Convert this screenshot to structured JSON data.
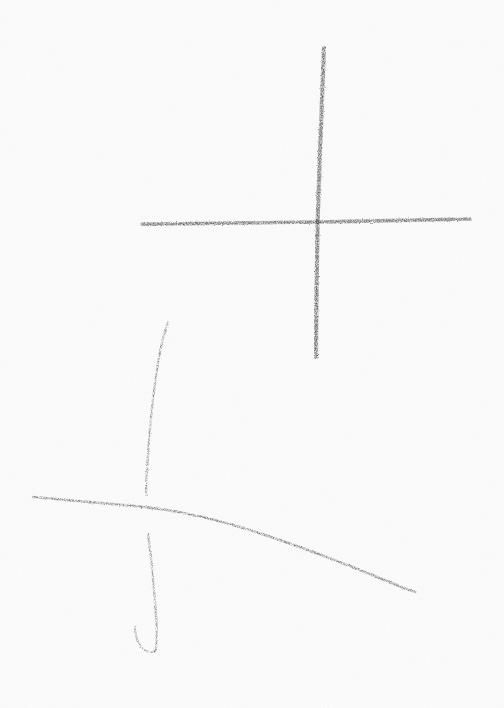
{
  "artwork": {
    "title": "Two hand-drawn crosses",
    "medium": "pencil-charcoal-sketch",
    "surface": "white-paper",
    "width": 504,
    "height": 708,
    "background_color": "#ffffff",
    "stroke_color": "#1a1a1a",
    "stroke_color_light": "#3a3a3a"
  },
  "figures": [
    {
      "name": "upper-cross",
      "weight": "heavy",
      "opacity": 0.96,
      "strokes": [
        {
          "name": "upper-cross-vertical-stroke",
          "orientation": "vertical",
          "width": 4.2,
          "opacity": 0.95,
          "start": [
            324,
            48
          ],
          "end": [
            316,
            357
          ],
          "path": "M 324.0 48.0 C 322.6 80.0 321.4 112.0 320.3 144.0 C 319.3 172.0 318.4 198.0 317.6 222.0 C 317.0 248.0 316.6 278.0 316.3 308.0 C 316.1 326.0 316.0 342.0 316.0 357.0"
        },
        {
          "name": "upper-cross-horizontal-stroke",
          "orientation": "horizontal",
          "width": 3.6,
          "opacity": 0.95,
          "start": [
            142,
            224
          ],
          "end": [
            470,
            219
          ],
          "path": "M 142.0 224.2 C 180.0 223.7 218.0 223.2 256.0 222.8 C 277.0 222.5 298.0 222.2 317.5 222.0 C 350.0 221.4 385.0 220.6 415.0 220.0 C 437.0 219.6 455.0 219.3 470.0 219.0"
        }
      ]
    },
    {
      "name": "lower-cross",
      "weight": "light",
      "opacity": 0.82,
      "strokes": [
        {
          "name": "lower-cross-vertical-upper-stroke",
          "orientation": "vertical",
          "width": 2.3,
          "opacity": 0.78,
          "start": [
            168,
            322
          ],
          "end": [
            146,
            495
          ],
          "path": "M 168.0 322.0 C 165.0 330.0 162.5 340.0 160.0 352.0 C 156.5 370.0 154.0 390.0 151.5 412.0 C 149.5 432.0 148.0 452.0 147.0 470.0 C 146.3 480.0 145.6 488.0 146.2 495.0"
        },
        {
          "name": "lower-cross-vertical-lower-stroke",
          "orientation": "vertical",
          "width": 2.3,
          "opacity": 0.78,
          "start": [
            148,
            535
          ],
          "end": [
            155,
            650
          ],
          "path": "M 148.2 535.0 C 150.0 548.0 151.6 562.0 152.8 576.0 C 154.0 590.0 155.2 604.0 156.2 618.0 C 156.8 628.0 157.0 638.0 156.2 646.0 C 155.8 649.5 155.4 651.0 154.6 651.5"
        },
        {
          "name": "lower-cross-bottom-hook-stroke",
          "orientation": "hook",
          "width": 2.0,
          "opacity": 0.74,
          "start": [
            154,
            651
          ],
          "end": [
            135,
            626
          ],
          "path": "M 154.6 651.5 C 151.0 652.5 147.0 652.0 143.5 649.5 C 140.0 646.5 137.5 641.5 136.0 636.0 C 135.0 632.0 134.8 628.5 135.2 626.0"
        },
        {
          "name": "lower-cross-horizontal-stroke",
          "orientation": "horizontal",
          "width": 2.6,
          "opacity": 0.8,
          "start": [
            33,
            497
          ],
          "end": [
            415,
            592
          ],
          "path": "M 33.0 497.0 C 60.0 499.5 90.0 502.0 118.0 504.5 C 135.0 506.0 150.0 507.5 163.0 509.5 C 190.0 513.5 215.0 519.5 240.0 527.0 C 268.0 535.5 295.0 545.0 320.0 554.5 C 345.0 564.0 365.0 572.0 382.0 579.0 C 395.0 584.5 406.0 589.0 415.0 592.0"
        }
      ]
    }
  ]
}
